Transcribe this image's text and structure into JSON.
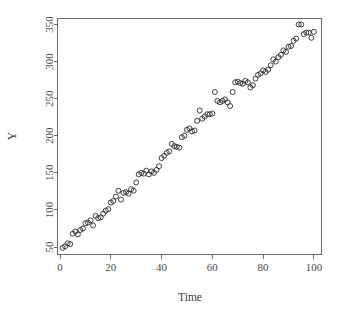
{
  "chart_data": {
    "type": "scatter",
    "title": "",
    "xlabel": "Time",
    "ylabel": "Y",
    "xlim": [
      -1,
      103
    ],
    "ylim": [
      40,
      358
    ],
    "xticks": [
      0,
      20,
      40,
      60,
      80,
      100
    ],
    "yticks": [
      50,
      100,
      150,
      200,
      250,
      300,
      350
    ],
    "xtick_labels": [
      "0",
      "20",
      "40",
      "60",
      "80",
      "100"
    ],
    "ytick_labels": [
      "50",
      "100",
      "150",
      "200",
      "250",
      "300",
      "350"
    ],
    "grid": false,
    "legend": false,
    "marker": "open-circle",
    "marker_color": "#2b2b2b",
    "box": true,
    "n_points": 100,
    "points": [
      [
        1,
        49
      ],
      [
        2,
        51
      ],
      [
        3,
        55
      ],
      [
        4,
        54
      ],
      [
        5,
        68
      ],
      [
        6,
        71
      ],
      [
        7,
        67
      ],
      [
        8,
        73
      ],
      [
        9,
        75
      ],
      [
        10,
        82
      ],
      [
        11,
        83
      ],
      [
        12,
        86
      ],
      [
        13,
        79
      ],
      [
        14,
        92
      ],
      [
        15,
        89
      ],
      [
        16,
        90
      ],
      [
        17,
        95
      ],
      [
        18,
        99
      ],
      [
        19,
        101
      ],
      [
        20,
        110
      ],
      [
        21,
        112
      ],
      [
        22,
        118
      ],
      [
        23,
        126
      ],
      [
        24,
        114
      ],
      [
        25,
        123
      ],
      [
        26,
        124
      ],
      [
        27,
        122
      ],
      [
        28,
        128
      ],
      [
        29,
        126
      ],
      [
        30,
        137
      ],
      [
        31,
        148
      ],
      [
        32,
        150
      ],
      [
        33,
        149
      ],
      [
        34,
        153
      ],
      [
        35,
        148
      ],
      [
        36,
        152
      ],
      [
        37,
        150
      ],
      [
        38,
        154
      ],
      [
        39,
        159
      ],
      [
        40,
        170
      ],
      [
        41,
        173
      ],
      [
        42,
        177
      ],
      [
        43,
        179
      ],
      [
        44,
        189
      ],
      [
        45,
        186
      ],
      [
        46,
        185
      ],
      [
        47,
        184
      ],
      [
        48,
        198
      ],
      [
        49,
        200
      ],
      [
        50,
        208
      ],
      [
        51,
        210
      ],
      [
        52,
        206
      ],
      [
        53,
        207
      ],
      [
        54,
        220
      ],
      [
        55,
        234
      ],
      [
        56,
        223
      ],
      [
        57,
        226
      ],
      [
        58,
        229
      ],
      [
        59,
        229
      ],
      [
        60,
        230
      ],
      [
        61,
        259
      ],
      [
        62,
        247
      ],
      [
        63,
        245
      ],
      [
        64,
        247
      ],
      [
        65,
        249
      ],
      [
        66,
        245
      ],
      [
        67,
        240
      ],
      [
        68,
        259
      ],
      [
        69,
        272
      ],
      [
        70,
        273
      ],
      [
        71,
        271
      ],
      [
        72,
        270
      ],
      [
        73,
        274
      ],
      [
        74,
        272
      ],
      [
        75,
        265
      ],
      [
        76,
        268
      ],
      [
        77,
        277
      ],
      [
        78,
        282
      ],
      [
        79,
        284
      ],
      [
        80,
        288
      ],
      [
        81,
        286
      ],
      [
        82,
        289
      ],
      [
        83,
        295
      ],
      [
        84,
        303
      ],
      [
        85,
        300
      ],
      [
        86,
        306
      ],
      [
        87,
        309
      ],
      [
        88,
        315
      ],
      [
        89,
        313
      ],
      [
        90,
        320
      ],
      [
        91,
        321
      ],
      [
        92,
        328
      ],
      [
        93,
        331
      ],
      [
        94,
        350
      ],
      [
        95,
        350
      ],
      [
        96,
        337
      ],
      [
        97,
        339
      ],
      [
        98,
        339
      ],
      [
        99,
        332
      ],
      [
        100,
        340
      ]
    ]
  },
  "figure": {
    "background": "#ffffff",
    "axis_color": "#6b6b6b",
    "text_color": "#4a4a4a",
    "point_color": "#2b2b2b"
  }
}
